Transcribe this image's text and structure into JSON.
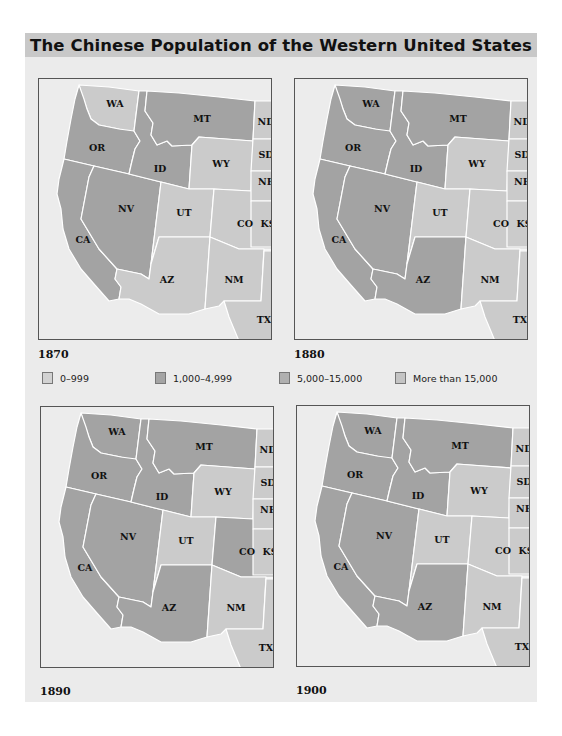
{
  "title": "The Chinese Population of the Western United States",
  "legend": [
    {
      "label": "0–999",
      "color": "#d2d2d2",
      "key": "c0"
    },
    {
      "label": "1,000–4,999",
      "color": "#a4a4a4",
      "key": "c1"
    },
    {
      "label": "5,000–15,000",
      "color": "#b0b0b0",
      "key": "c2"
    },
    {
      "label": "More than 15,000",
      "color": "#c4c4c4",
      "key": "c3"
    }
  ],
  "fills": {
    "light": "#cbcbcb",
    "dark": "#a3a3a3"
  },
  "maps": [
    {
      "year": "1870",
      "states": {
        "WA": "light",
        "OR": "dark",
        "CA": "dark",
        "ID": "dark",
        "NV": "dark",
        "MT": "dark",
        "WY": "light",
        "UT": "light",
        "CO": "light",
        "AZ": "light",
        "NM": "light",
        "ND": "light",
        "SD": "light",
        "NE": "light",
        "KS": "light",
        "TX": "light"
      }
    },
    {
      "year": "1880",
      "states": {
        "WA": "dark",
        "OR": "dark",
        "CA": "dark",
        "ID": "dark",
        "NV": "dark",
        "MT": "dark",
        "WY": "light",
        "UT": "light",
        "CO": "light",
        "AZ": "dark",
        "NM": "light",
        "ND": "light",
        "SD": "light",
        "NE": "light",
        "KS": "light",
        "TX": "light"
      }
    },
    {
      "year": "1890",
      "states": {
        "WA": "dark",
        "OR": "dark",
        "CA": "dark",
        "ID": "dark",
        "NV": "dark",
        "MT": "dark",
        "WY": "light",
        "UT": "light",
        "CO": "dark",
        "AZ": "dark",
        "NM": "light",
        "ND": "light",
        "SD": "light",
        "NE": "light",
        "KS": "light",
        "TX": "light"
      }
    },
    {
      "year": "1900",
      "states": {
        "WA": "dark",
        "OR": "dark",
        "CA": "dark",
        "ID": "dark",
        "NV": "dark",
        "MT": "dark",
        "WY": "light",
        "UT": "light",
        "CO": "light",
        "AZ": "dark",
        "NM": "light",
        "ND": "light",
        "SD": "light",
        "NE": "light",
        "KS": "light",
        "TX": "light"
      }
    }
  ],
  "state_labels": [
    "WA",
    "OR",
    "CA",
    "ID",
    "NV",
    "MT",
    "WY",
    "UT",
    "CO",
    "AZ",
    "NM",
    "ND",
    "SD",
    "NE",
    "KS",
    "TX"
  ]
}
